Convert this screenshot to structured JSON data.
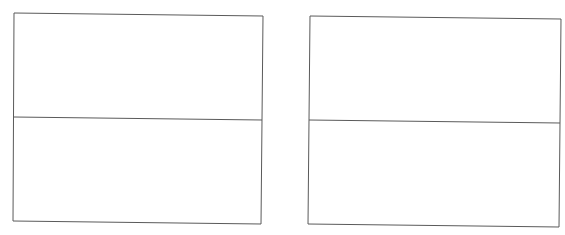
{
  "diagram": {
    "stroke_color": "#5a5a5a",
    "boxes": [
      {
        "name": "left-box",
        "points": "14,13 263,16 261,224 13,221",
        "divider": [
          14,
          117,
          262,
          120
        ]
      },
      {
        "name": "right-box",
        "points": "310,16 561,19 559,227 308,224",
        "divider": [
          309,
          120,
          560,
          123
        ]
      }
    ]
  }
}
